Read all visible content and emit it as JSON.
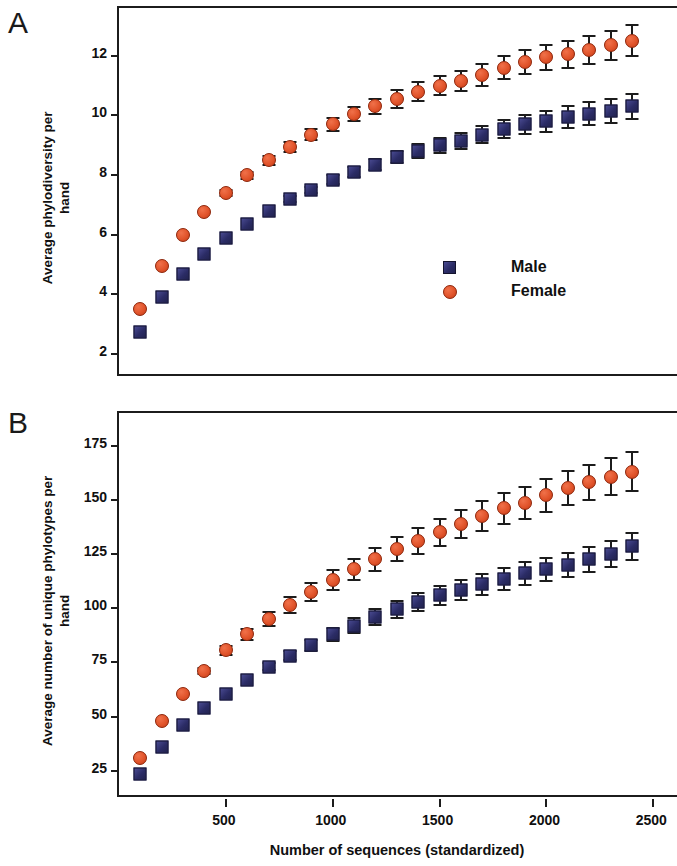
{
  "figure": {
    "panel_a_letter": "A",
    "panel_b_letter": "B",
    "xlabel": "Number of sequences (standardized)"
  },
  "legend": {
    "position": "inside-panel-a-lower-right",
    "entries": [
      {
        "label": "Male",
        "symbol": "filled-square-icon",
        "color": "#343578"
      },
      {
        "label": "Female",
        "symbol": "filled-circle-icon",
        "color": "#e1542b"
      }
    ]
  },
  "colors": {
    "male": "#343578",
    "female": "#e1542b",
    "axis": "#1c1c1c",
    "text": "#101010",
    "background": "#ffffff"
  },
  "chart_data": [
    {
      "id": "panel-a",
      "type": "scatter",
      "title": "A",
      "xlabel": "Number of sequences (standardized)",
      "ylabel": "Average phylodiversity per hand",
      "xlim": [
        0,
        2620
      ],
      "ylim": [
        1.2,
        13.6
      ],
      "xticks": [
        500,
        1000,
        1500,
        2000,
        2500
      ],
      "yticks": [
        2,
        4,
        6,
        8,
        10,
        12
      ],
      "grid": false,
      "errorbars": true,
      "x": [
        100,
        200,
        300,
        400,
        500,
        600,
        700,
        800,
        900,
        1000,
        1100,
        1200,
        1300,
        1400,
        1500,
        1600,
        1700,
        1800,
        1900,
        2000,
        2100,
        2200,
        2300,
        2400
      ],
      "series": [
        {
          "name": "Male",
          "color": "#343578",
          "marker": "square",
          "values": [
            2.75,
            3.9,
            4.7,
            5.35,
            5.9,
            6.35,
            6.8,
            7.2,
            7.5,
            7.85,
            8.1,
            8.35,
            8.6,
            8.8,
            9.0,
            9.15,
            9.35,
            9.55,
            9.7,
            9.8,
            9.95,
            10.05,
            10.15,
            10.3
          ],
          "errors": [
            0.0,
            0.0,
            0.0,
            0.0,
            0.0,
            0.0,
            0.0,
            0.12,
            0.15,
            0.18,
            0.2,
            0.22,
            0.24,
            0.26,
            0.28,
            0.3,
            0.32,
            0.34,
            0.36,
            0.38,
            0.4,
            0.42,
            0.44,
            0.46
          ]
        },
        {
          "name": "Female",
          "color": "#e1542b",
          "marker": "circle",
          "values": [
            3.5,
            4.95,
            6.0,
            6.75,
            7.4,
            8.0,
            8.5,
            8.95,
            9.35,
            9.7,
            10.05,
            10.3,
            10.55,
            10.8,
            11.0,
            11.15,
            11.35,
            11.6,
            11.8,
            11.95,
            12.05,
            12.2,
            12.35,
            12.5
          ],
          "errors": [
            0.0,
            0.0,
            0.0,
            0.0,
            0.12,
            0.15,
            0.18,
            0.2,
            0.22,
            0.25,
            0.27,
            0.3,
            0.32,
            0.34,
            0.36,
            0.38,
            0.4,
            0.42,
            0.44,
            0.46,
            0.48,
            0.5,
            0.52,
            0.55
          ]
        }
      ]
    },
    {
      "id": "panel-b",
      "type": "scatter",
      "title": "B",
      "xlabel": "Number of sequences (standardized)",
      "ylabel": "Average number of unique phylotypes per hand",
      "xlim": [
        0,
        2620
      ],
      "ylim": [
        12,
        190
      ],
      "xticks": [
        500,
        1000,
        1500,
        2000,
        2500
      ],
      "yticks": [
        25,
        50,
        75,
        100,
        125,
        150,
        175
      ],
      "grid": false,
      "errorbars": true,
      "x": [
        100,
        200,
        300,
        400,
        500,
        600,
        700,
        800,
        900,
        1000,
        1100,
        1200,
        1300,
        1400,
        1500,
        1600,
        1700,
        1800,
        1900,
        2000,
        2100,
        2200,
        2300,
        2400
      ],
      "series": [
        {
          "name": "Male",
          "color": "#343578",
          "marker": "square",
          "values": [
            23.5,
            36,
            46,
            54,
            60.5,
            67,
            73,
            78,
            83,
            88,
            92,
            96,
            99.5,
            103,
            106,
            108.5,
            111,
            113.5,
            116,
            118,
            120,
            122.5,
            125,
            128.5
          ],
          "errors": [
            0.0,
            0.0,
            0.0,
            0.0,
            0.0,
            0.0,
            2.0,
            2.5,
            3.0,
            3.5,
            3.8,
            4.0,
            4.3,
            4.6,
            4.8,
            5.0,
            5.2,
            5.4,
            5.6,
            5.8,
            6.0,
            6.2,
            6.5,
            6.8
          ]
        },
        {
          "name": "Female",
          "color": "#e1542b",
          "marker": "circle",
          "values": [
            31,
            48,
            60.5,
            71,
            80.5,
            88,
            95,
            101.5,
            107.5,
            113,
            118,
            122.5,
            127.5,
            131,
            135,
            139,
            142.5,
            146,
            148.5,
            152,
            155.5,
            158,
            160.5,
            163
          ],
          "errors": [
            0.0,
            0.0,
            0.0,
            2.0,
            2.5,
            3.0,
            3.5,
            4.0,
            4.5,
            5.0,
            5.3,
            5.6,
            6.0,
            6.3,
            6.6,
            6.9,
            7.2,
            7.5,
            7.8,
            8.1,
            8.4,
            8.7,
            9.0,
            9.4
          ]
        }
      ]
    }
  ]
}
